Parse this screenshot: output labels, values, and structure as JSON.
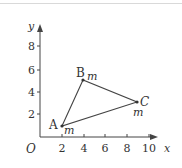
{
  "figure": {
    "axes": {
      "x_label": "x",
      "y_label": "y",
      "origin_label": "O",
      "x_ticks": [
        "2",
        "4",
        "6",
        "8",
        "10"
      ],
      "y_ticks": [
        "2",
        "4",
        "6",
        "8"
      ]
    },
    "points": [
      {
        "name": "A",
        "x": 2,
        "y": 1,
        "mark": "m"
      },
      {
        "name": "B",
        "x": 4,
        "y": 5,
        "mark": "m"
      },
      {
        "name": "C",
        "x": 9,
        "y": 3,
        "mark": "m"
      }
    ],
    "shape": "triangle ABC",
    "colors": {
      "line": "#444444",
      "text": "#333333",
      "border": "#d9d9d9"
    }
  }
}
